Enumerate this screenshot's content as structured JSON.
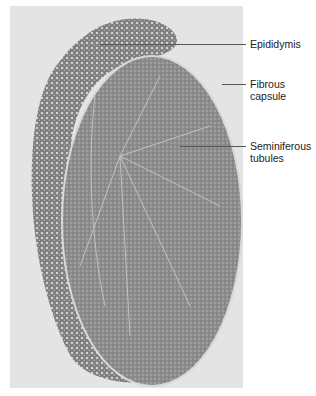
{
  "figure": {
    "type": "histology micrograph",
    "background_color": "#e4e4e4",
    "tissue_color": "#8a8a8a"
  },
  "labels": [
    {
      "id": "epididymis",
      "text": "Epididymis",
      "y": 44
    },
    {
      "id": "fibrous_capsule",
      "text": "Fibrous capsule",
      "line1": "Fibrous",
      "line2": "capsule",
      "y": 84
    },
    {
      "id": "seminiferous_tubules",
      "text": "Seminiferous tubules",
      "line1": "Seminiferous",
      "line2": "tubules",
      "y": 146
    }
  ]
}
